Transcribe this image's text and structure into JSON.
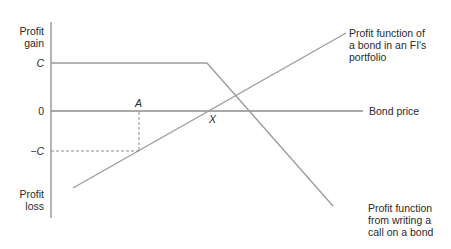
{
  "diagram": {
    "axis": {
      "y_top_label": [
        "Profit",
        "gain"
      ],
      "y_bottom_label": [
        "Profit",
        "loss"
      ],
      "x_label": "Bond price"
    },
    "ticks": {
      "c": "C",
      "zero": "0",
      "neg_c": "−C"
    },
    "points": {
      "a": "A",
      "x": "X"
    },
    "annotations": {
      "bond": [
        "Profit function of",
        "a bond in an FI's",
        "portfolio"
      ],
      "call": [
        "Profit function",
        "from writing a",
        "call on a bond"
      ]
    },
    "colors": {
      "line": "#9a9a9a",
      "axis": "#8c8c8c",
      "text": "#2a2a2a"
    }
  }
}
